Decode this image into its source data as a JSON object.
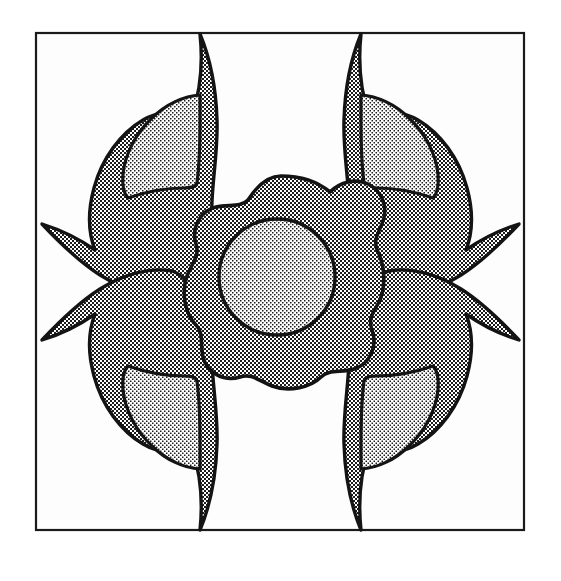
{
  "artwork": {
    "title": "Four-fold floral appliqué block pattern",
    "description": "Square line-art frame enclosing a four-fold rotationally symmetric floral motif: one central rounded-square flower with a circular center, surrounded by four identical corner leaf-flower motifs.",
    "medium": "halftone dot shaded line drawing",
    "canvas": {
      "width": 561,
      "height": 581,
      "background_color": "#ffffff"
    },
    "frame": {
      "name": "square border",
      "x": 36,
      "y": 33,
      "width": 488,
      "height": 497,
      "stroke_color": "#1a1a1a",
      "stroke_width": 2.2,
      "fill_color": "#fdfdfd"
    },
    "colors": {
      "outline": "#141414",
      "shade_dark": "#6e6e6e",
      "shade_light": "#b9b9b9",
      "paper": "#ffffff",
      "inner_paper": "#fdfdfd"
    },
    "tones": {
      "dark_halftone_label": "dark 50% checkerboard halftone",
      "dark_halftone_cell_px": 2,
      "light_halftone_label": "light open checkerboard halftone",
      "light_halftone_cell_px": 3
    },
    "center_motif": {
      "name": "central flower",
      "center_x": 281,
      "center_y": 281,
      "outer_radius": 105,
      "lobes": 4,
      "fill_tone": "dark",
      "inner_disc": {
        "name": "flower center disc",
        "center_x": 277,
        "center_y": 277,
        "radius": 58,
        "fill_tone": "light"
      }
    },
    "corner_motifs": [
      {
        "name": "top-left leaf flower",
        "position": "top-left",
        "anchor_x": 140,
        "anchor_y": 140,
        "rotation_deg": 0,
        "fill_tone": "dark",
        "inner_leaf_tone": "light"
      },
      {
        "name": "top-right leaf flower",
        "position": "top-right",
        "anchor_x": 422,
        "anchor_y": 140,
        "rotation_deg": 90,
        "fill_tone": "dark",
        "inner_leaf_tone": "light"
      },
      {
        "name": "bottom-right leaf flower",
        "position": "bottom-right",
        "anchor_x": 422,
        "anchor_y": 424,
        "rotation_deg": 180,
        "fill_tone": "dark",
        "inner_leaf_tone": "light"
      },
      {
        "name": "bottom-left leaf flower",
        "position": "bottom-left",
        "anchor_x": 140,
        "anchor_y": 424,
        "rotation_deg": 270,
        "fill_tone": "dark",
        "inner_leaf_tone": "light"
      }
    ]
  }
}
